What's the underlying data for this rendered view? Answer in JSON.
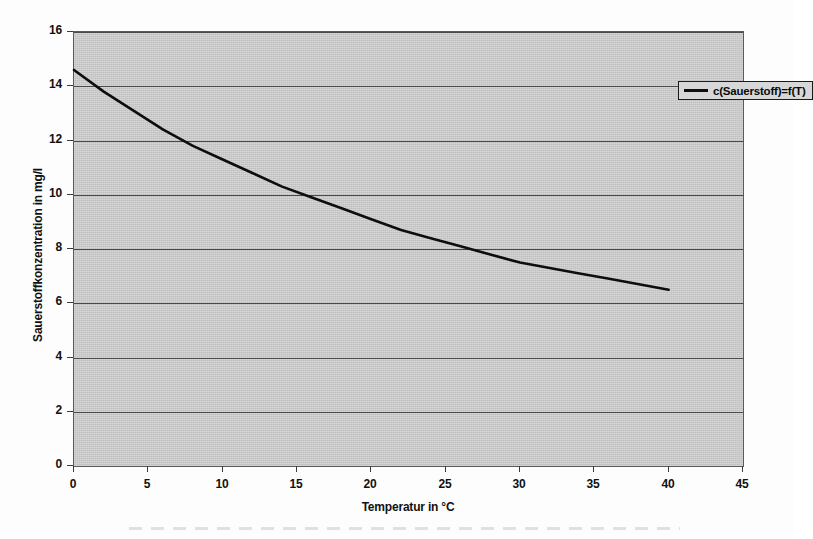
{
  "chart_data": {
    "type": "line",
    "title": "",
    "xlabel": "Temperatur in °C",
    "ylabel": "Sauerstoffkonzentration in mg/l",
    "xlim": [
      0,
      45
    ],
    "ylim": [
      0,
      16
    ],
    "xticks": [
      "0",
      "5",
      "10",
      "15",
      "20",
      "25",
      "30",
      "35",
      "40",
      "45"
    ],
    "yticks": [
      "0",
      "2",
      "4",
      "6",
      "8",
      "10",
      "12",
      "14",
      "16"
    ],
    "xtick_values": [
      0,
      5,
      10,
      15,
      20,
      25,
      30,
      35,
      40,
      45
    ],
    "ytick_values": [
      0,
      2,
      4,
      6,
      8,
      10,
      12,
      14,
      16
    ],
    "grid": "horizontal",
    "legend_position": "top-right",
    "plot_background": "#c9c9c9",
    "line_color": "#0d0d0d",
    "series": [
      {
        "name": "c(Sauerstoff)=f(T)",
        "x": [
          0,
          2,
          4,
          6,
          8,
          10,
          12,
          14,
          16,
          18,
          20,
          22,
          24,
          26,
          28,
          30,
          32,
          34,
          36,
          38,
          40
        ],
        "values": [
          14.6,
          13.8,
          13.1,
          12.4,
          11.8,
          11.3,
          10.8,
          10.3,
          9.9,
          9.5,
          9.1,
          8.7,
          8.4,
          8.1,
          7.8,
          7.5,
          7.3,
          7.1,
          6.9,
          6.7,
          6.5
        ]
      }
    ],
    "annotations": []
  },
  "legend": {
    "entries": [
      {
        "label": "c(Sauerstoff)=f(T)",
        "color": "#0d0d0d"
      }
    ]
  }
}
